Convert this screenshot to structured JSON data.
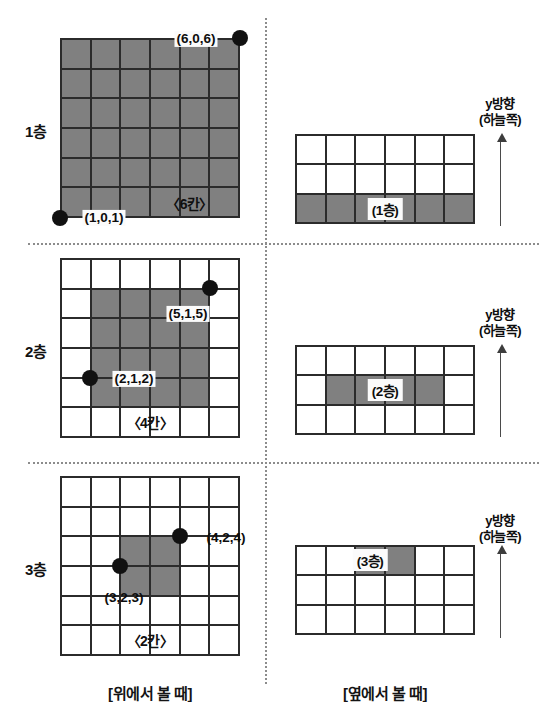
{
  "figure": {
    "gray_hex": "#808080",
    "line_hex": "#2b2b2b",
    "dot_hex": "#111111"
  },
  "captions": {
    "top_view": "[위에서 볼 때]",
    "side_view": "[옆에서 볼 때]"
  },
  "axis": {
    "label_line1": "y방향",
    "label_line2": "(하늘쪽)"
  },
  "layers": [
    {
      "id": "floor-1",
      "label": "1층",
      "floor_tag": "(1층)",
      "span_note": "〈6칸〉",
      "top_view": {
        "cols": 6,
        "rows": 6,
        "filled": [
          [
            1,
            1,
            1,
            1,
            1,
            1
          ],
          [
            1,
            1,
            1,
            1,
            1,
            1
          ],
          [
            1,
            1,
            1,
            1,
            1,
            1
          ],
          [
            1,
            1,
            1,
            1,
            1,
            1
          ],
          [
            1,
            1,
            1,
            1,
            1,
            1
          ],
          [
            1,
            1,
            1,
            1,
            1,
            1
          ]
        ]
      },
      "side_view": {
        "cols": 6,
        "rows": 3,
        "filled": [
          [
            0,
            0,
            0,
            0,
            0,
            0
          ],
          [
            0,
            0,
            0,
            0,
            0,
            0
          ],
          [
            1,
            1,
            1,
            1,
            1,
            1
          ]
        ]
      },
      "points": [
        {
          "label": "(6,0,6)",
          "col": 6,
          "row": 0,
          "tag_dx": -44,
          "tag_dy": 1,
          "boxed": true
        },
        {
          "label": "(1,0,1)",
          "col": 0,
          "row": 6,
          "tag_dx": 44,
          "tag_dy": 0,
          "boxed": true
        }
      ]
    },
    {
      "id": "floor-2",
      "label": "2층",
      "floor_tag": "(2층)",
      "span_note": "〈4칸〉",
      "top_view": {
        "cols": 6,
        "rows": 6,
        "filled": [
          [
            0,
            0,
            0,
            0,
            0,
            0
          ],
          [
            0,
            1,
            1,
            1,
            1,
            0
          ],
          [
            0,
            1,
            1,
            1,
            1,
            0
          ],
          [
            0,
            1,
            1,
            1,
            1,
            0
          ],
          [
            0,
            1,
            1,
            1,
            1,
            0
          ],
          [
            0,
            0,
            0,
            0,
            0,
            0
          ]
        ]
      },
      "side_view": {
        "cols": 6,
        "rows": 3,
        "filled": [
          [
            0,
            0,
            0,
            0,
            0,
            0
          ],
          [
            0,
            1,
            1,
            1,
            1,
            0
          ],
          [
            0,
            0,
            0,
            0,
            0,
            0
          ]
        ]
      },
      "points": [
        {
          "label": "(5,1,5)",
          "col": 5,
          "row": 1,
          "tag_dx": -22,
          "tag_dy": 26,
          "boxed": true
        },
        {
          "label": "(2,1,2)",
          "col": 1,
          "row": 4,
          "tag_dx": 44,
          "tag_dy": 1,
          "boxed": true
        }
      ]
    },
    {
      "id": "floor-3",
      "label": "3층",
      "floor_tag": "(3층)",
      "span_note": "〈2칸〉",
      "top_view": {
        "cols": 6,
        "rows": 6,
        "filled": [
          [
            0,
            0,
            0,
            0,
            0,
            0
          ],
          [
            0,
            0,
            0,
            0,
            0,
            0
          ],
          [
            0,
            0,
            1,
            1,
            0,
            0
          ],
          [
            0,
            0,
            1,
            1,
            0,
            0
          ],
          [
            0,
            0,
            0,
            0,
            0,
            0
          ],
          [
            0,
            0,
            0,
            0,
            0,
            0
          ]
        ]
      },
      "side_view": {
        "cols": 6,
        "rows": 3,
        "filled": [
          [
            0,
            0,
            1,
            1,
            0,
            0
          ],
          [
            0,
            0,
            0,
            0,
            0,
            0
          ],
          [
            0,
            0,
            0,
            0,
            0,
            0
          ]
        ]
      },
      "points": [
        {
          "label": "(4,2,4)",
          "col": 4,
          "row": 2,
          "tag_dx": 46,
          "tag_dy": 2,
          "boxed": false
        },
        {
          "label": "(3,2,3)",
          "col": 2,
          "row": 3,
          "tag_dx": 4,
          "tag_dy": 32,
          "boxed": false
        }
      ]
    }
  ]
}
